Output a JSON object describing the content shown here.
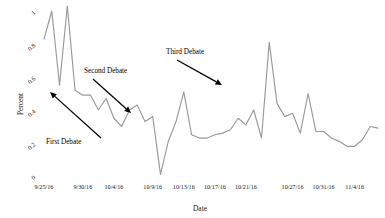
{
  "chart_data": {
    "type": "line",
    "title": "",
    "xlabel": "Date",
    "ylabel": "Percent",
    "ylim": [
      0,
      1.05
    ],
    "grid": false,
    "legend": "none",
    "ytick_values": [
      0,
      0.2,
      0.4,
      0.6,
      0.8,
      1
    ],
    "ytick_labels": [
      "0",
      "0.2",
      "0.4",
      "0.6",
      "0.8",
      "1"
    ],
    "xtick_labels": [
      "9/25/16",
      "9/30/16",
      "10/4/16",
      "10/9/16",
      "10/13/16",
      "10/17/16",
      "10/21/16",
      "10/27/16",
      "10/31/16",
      "11/4/16"
    ],
    "xtick_indices": [
      0,
      5,
      9,
      14,
      18,
      22,
      26,
      32,
      36,
      40
    ],
    "series": [
      {
        "name": "Percent",
        "color": "#999999",
        "x": [
          0,
          1,
          2,
          3,
          4,
          5,
          6,
          7,
          8,
          9,
          10,
          11,
          12,
          13,
          14,
          15,
          16,
          17,
          18,
          19,
          20,
          21,
          22,
          23,
          24,
          25,
          26,
          27,
          28,
          29,
          30,
          31,
          32,
          33,
          34,
          35,
          36,
          37,
          38,
          39,
          40,
          41,
          42,
          43
        ],
        "values": [
          0.83,
          1.0,
          0.55,
          1.03,
          0.52,
          0.49,
          0.49,
          0.4,
          0.47,
          0.35,
          0.3,
          0.4,
          0.43,
          0.33,
          0.36,
          0.01,
          0.21,
          0.33,
          0.51,
          0.25,
          0.23,
          0.23,
          0.25,
          0.26,
          0.28,
          0.35,
          0.31,
          0.4,
          0.23,
          0.81,
          0.44,
          0.36,
          0.38,
          0.26,
          0.5,
          0.27,
          0.27,
          0.23,
          0.21,
          0.18,
          0.18,
          0.22,
          0.3,
          0.29
        ]
      }
    ],
    "annotations": [
      {
        "label": "First Debate",
        "label_x": 46,
        "label_y": 144,
        "arrow_from_x": 101,
        "arrow_from_y": 138,
        "arrow_to_x": 50,
        "arrow_to_y": 92
      },
      {
        "label": "Second Debate",
        "label_x": 84,
        "label_y": 73,
        "arrow_from_x": 93,
        "arrow_from_y": 79,
        "arrow_to_x": 131,
        "arrow_to_y": 113
      },
      {
        "label": "Third Debate",
        "label_x": 166,
        "label_y": 54,
        "arrow_from_x": 177,
        "arrow_from_y": 60,
        "arrow_to_x": 222,
        "arrow_to_y": 85
      }
    ]
  },
  "figure": {
    "background": "#ffffff",
    "line_color": "#999999",
    "text_color": "#1a1a1a",
    "annotation_color": "#000000"
  }
}
